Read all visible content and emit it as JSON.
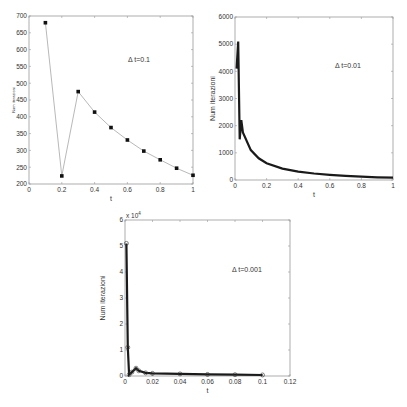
{
  "chart_data": [
    {
      "type": "line",
      "title": "",
      "annotation": "Δt=0.1",
      "xlabel": "t",
      "ylabel": "Num iterazioni",
      "xlim": [
        0,
        1
      ],
      "ylim": [
        200,
        700
      ],
      "xticks": [
        "0",
        "0.2",
        "0.4",
        "0.6",
        "0.8",
        "1"
      ],
      "yticks": [
        "200",
        "250",
        "300",
        "350",
        "400",
        "450",
        "500",
        "550",
        "600",
        "650",
        "700"
      ],
      "grid": false,
      "marker": "square",
      "x": [
        0.1,
        0.2,
        0.3,
        0.4,
        0.5,
        0.6,
        0.7,
        0.8,
        0.9,
        1.0
      ],
      "y": [
        680,
        224,
        475,
        414,
        368,
        331,
        298,
        272,
        247,
        226
      ]
    },
    {
      "type": "line",
      "title": "",
      "annotation": "Δt=0.01",
      "xlabel": "t",
      "ylabel": "Num iterazioni",
      "xlim": [
        0,
        1
      ],
      "ylim": [
        0,
        6000
      ],
      "xticks": [
        "0",
        "0.2",
        "0.4",
        "0.6",
        "0.8",
        "1"
      ],
      "yticks": [
        "0",
        "1000",
        "2000",
        "3000",
        "4000",
        "5000",
        "6000"
      ],
      "grid": false,
      "marker": "square",
      "x": [
        0.01,
        0.02,
        0.03,
        0.04,
        0.05,
        0.1,
        0.15,
        0.2,
        0.3,
        0.4,
        0.5,
        0.6,
        0.7,
        0.8,
        0.9,
        1.0
      ],
      "y": [
        4100,
        5100,
        1500,
        2200,
        1750,
        1100,
        800,
        620,
        420,
        310,
        240,
        190,
        150,
        120,
        100,
        85
      ]
    },
    {
      "type": "line",
      "title": "",
      "annotation": "Δt=0.001",
      "xlabel": "t",
      "ylabel": "Num iterazioni",
      "y_scale_label": "x 10^4",
      "xlim": [
        0,
        0.12
      ],
      "ylim": [
        0,
        6
      ],
      "xticks": [
        "0",
        "0.02",
        "0.04",
        "0.06",
        "0.08",
        "0.1",
        "0.12"
      ],
      "yticks": [
        "0",
        "1",
        "2",
        "3",
        "4",
        "5",
        "6"
      ],
      "grid": false,
      "marker": "circle",
      "x": [
        0.001,
        0.002,
        0.003,
        0.005,
        0.008,
        0.01,
        0.015,
        0.02,
        0.04,
        0.06,
        0.08,
        0.1
      ],
      "y": [
        5.1,
        1.1,
        0.05,
        0.15,
        0.3,
        0.2,
        0.12,
        0.1,
        0.08,
        0.06,
        0.05,
        0.04
      ]
    }
  ],
  "labels": {
    "p1": {
      "ann": "Δ t=0.1",
      "xlabel": "t",
      "ylabel": "Num iterazioni"
    },
    "p2": {
      "ann": "Δ t=0.01",
      "xlabel": "t",
      "ylabel": "Num iterazioni"
    },
    "p3": {
      "ann": "Δ t=0.001",
      "xlabel": "t",
      "ylabel": "Num iterazioni",
      "scale": "x 10"
    }
  }
}
